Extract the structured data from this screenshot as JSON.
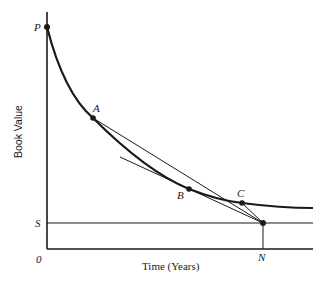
{
  "diagram": {
    "y_axis_label": "Book Value",
    "x_axis_label": "Time (Years)",
    "origin_label": "0",
    "colors": {
      "ink": "#1a1a1a",
      "background": "#ffffff"
    },
    "points": {
      "P": {
        "label": "P",
        "x": 47,
        "y": 27
      },
      "A": {
        "label": "A",
        "x": 93,
        "y": 118
      },
      "B": {
        "label": "B",
        "x": 189,
        "y": 189
      },
      "C": {
        "label": "C",
        "x": 242,
        "y": 203
      },
      "N": {
        "label": "N",
        "x": 263,
        "y": 223
      }
    },
    "levels": {
      "S": {
        "label": "S",
        "y": 223
      }
    },
    "lines": [
      {
        "name": "chord-A-N",
        "from": "A",
        "to": "N"
      },
      {
        "name": "tangent-at-B",
        "from": [
          120,
          157
        ],
        "to": "N"
      },
      {
        "name": "chord-C-N",
        "from": "C",
        "to": "N"
      },
      {
        "name": "salvage-line-S",
        "y": 223
      },
      {
        "name": "drop-N-to-axis",
        "from": "N",
        "to_axis": true
      }
    ]
  }
}
